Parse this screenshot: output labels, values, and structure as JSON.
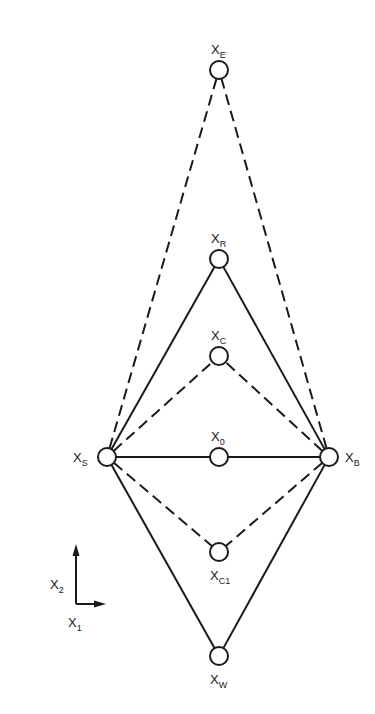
{
  "diagram": {
    "type": "simplex-geometry",
    "stroke_color": "#1a1a1a",
    "background": "#ffffff",
    "nodes": [
      {
        "id": "XE",
        "base": "X",
        "sub": "E",
        "cx": 219,
        "cy": 70,
        "label_pos": "above"
      },
      {
        "id": "XR",
        "base": "X",
        "sub": "R",
        "cx": 219,
        "cy": 259,
        "label_pos": "above"
      },
      {
        "id": "XC",
        "base": "X",
        "sub": "C",
        "cx": 219,
        "cy": 356,
        "label_pos": "above"
      },
      {
        "id": "X0",
        "base": "X",
        "sub": "0",
        "cx": 219,
        "cy": 457,
        "label_pos": "above"
      },
      {
        "id": "XS",
        "base": "X",
        "sub": "S",
        "cx": 107,
        "cy": 457,
        "label_pos": "left"
      },
      {
        "id": "XB",
        "base": "X",
        "sub": "B",
        "cx": 329,
        "cy": 457,
        "label_pos": "right"
      },
      {
        "id": "XC1",
        "base": "X",
        "sub": "C1",
        "cx": 219,
        "cy": 552,
        "label_pos": "below"
      },
      {
        "id": "XW",
        "base": "X",
        "sub": "W",
        "cx": 219,
        "cy": 656,
        "label_pos": "below"
      }
    ],
    "edges": [
      {
        "from": "XS",
        "to": "XE",
        "style": "dashed"
      },
      {
        "from": "XB",
        "to": "XE",
        "style": "dashed"
      },
      {
        "from": "XS",
        "to": "XR",
        "style": "solid"
      },
      {
        "from": "XB",
        "to": "XR",
        "style": "solid"
      },
      {
        "from": "XS",
        "to": "XC",
        "style": "dashed"
      },
      {
        "from": "XB",
        "to": "XC",
        "style": "dashed"
      },
      {
        "from": "XS",
        "to": "X0",
        "style": "solid"
      },
      {
        "from": "X0",
        "to": "XB",
        "style": "solid"
      },
      {
        "from": "XS",
        "to": "XC1",
        "style": "dashed"
      },
      {
        "from": "XB",
        "to": "XC1",
        "style": "dashed"
      },
      {
        "from": "XS",
        "to": "XW",
        "style": "solid"
      },
      {
        "from": "XB",
        "to": "XW",
        "style": "solid"
      }
    ],
    "axes": {
      "origin": [
        76,
        604
      ],
      "x_axis": {
        "base": "X",
        "sub": "1"
      },
      "y_axis": {
        "base": "X",
        "sub": "2"
      }
    }
  }
}
